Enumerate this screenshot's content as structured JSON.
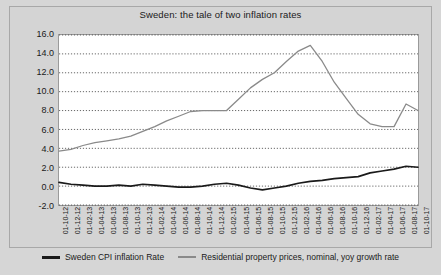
{
  "title": "Sweden: the tale of two inflation rates",
  "axis": {
    "y_unit": "%",
    "y_ticks": [
      "16.0",
      "14.0",
      "12.0",
      "10.0",
      "8.0",
      "6.0",
      "4.0",
      "2.0",
      "0.0",
      "-2.0"
    ],
    "ylim": [
      -2,
      16
    ],
    "x_ticks": [
      "01-10-12",
      "01-12-12",
      "01-02-13",
      "01-04-13",
      "01-06-13",
      "01-08-13",
      "01-10-13",
      "01-12-13",
      "01-02-14",
      "01-04-14",
      "01-06-14",
      "01-08-14",
      "01-10-14",
      "01-12-14",
      "01-02-15",
      "01-04-15",
      "01-06-15",
      "01-08-15",
      "01-10-15",
      "01-12-15",
      "01-02-16",
      "01-04-16",
      "01-06-16",
      "01-08-16",
      "01-10-16",
      "01-12-16",
      "01-02-17",
      "01-04-17",
      "01-06-17",
      "01-08-17",
      "01-10-17"
    ]
  },
  "legend": {
    "items": [
      {
        "label": "Sweden CPI inflation Rate",
        "color": "#1a1a1a"
      },
      {
        "label": "Residential property prices, nominal, yoy growth rate",
        "color": "#8a8a8a"
      }
    ]
  },
  "chart_data": {
    "type": "line",
    "title": "Sweden: the tale of two inflation rates",
    "xlabel": "",
    "ylabel": "%",
    "ylim": [
      -2,
      16
    ],
    "grid": true,
    "legend_position": "bottom",
    "categories": [
      "01-10-12",
      "01-12-12",
      "01-02-13",
      "01-04-13",
      "01-06-13",
      "01-08-13",
      "01-10-13",
      "01-12-13",
      "01-02-14",
      "01-04-14",
      "01-06-14",
      "01-08-14",
      "01-10-14",
      "01-12-14",
      "01-02-15",
      "01-04-15",
      "01-06-15",
      "01-08-15",
      "01-10-15",
      "01-12-15",
      "01-02-16",
      "01-04-16",
      "01-06-16",
      "01-08-16",
      "01-10-16",
      "01-12-16",
      "01-02-17",
      "01-04-17",
      "01-06-17",
      "01-08-17",
      "01-10-17"
    ],
    "series": [
      {
        "name": "Sweden CPI inflation Rate",
        "color": "#1a1a1a",
        "values": [
          0.4,
          0.2,
          0.1,
          0.0,
          0.0,
          0.1,
          0.0,
          0.2,
          0.1,
          0.0,
          -0.1,
          -0.1,
          0.0,
          0.2,
          0.3,
          0.1,
          -0.2,
          -0.4,
          -0.2,
          0.0,
          0.3,
          0.5,
          0.6,
          0.8,
          0.9,
          1.0,
          1.4,
          1.6,
          1.8,
          2.1,
          2.0
        ]
      },
      {
        "name": "Residential property prices, nominal, yoy growth rate",
        "color": "#8a8a8a",
        "values": [
          3.7,
          3.9,
          4.3,
          4.6,
          4.8,
          5.0,
          5.3,
          5.8,
          6.3,
          6.9,
          7.4,
          7.9,
          8.0,
          8.0,
          8.0,
          9.2,
          10.4,
          11.3,
          12.0,
          13.2,
          14.3,
          14.9,
          13.2,
          11.0,
          9.3,
          7.6,
          6.6,
          6.3,
          6.3,
          8.7,
          8.0
        ]
      }
    ]
  }
}
